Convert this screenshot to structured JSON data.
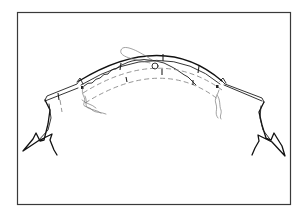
{
  "figure": {
    "type": "line-drawing",
    "colors": {
      "background": "#ffffff",
      "line": "#1e1e1e",
      "stitch": "#8a8a8a",
      "thread": "#7a7a7a",
      "frame": "#3a3a3a"
    },
    "elements": [
      {
        "name": "frame-border",
        "kind": "rectangle"
      },
      {
        "name": "outer-seam-edge",
        "kind": "double-line-arc"
      },
      {
        "name": "gathered-edge",
        "kind": "wavy-line"
      },
      {
        "name": "stitch-line-upper",
        "kind": "dashed-arc"
      },
      {
        "name": "stitch-line-lower",
        "kind": "dashed-arc"
      },
      {
        "name": "notch-marks",
        "kind": "ticks",
        "count": 5
      },
      {
        "name": "thread-loop",
        "kind": "loop-with-knot"
      },
      {
        "name": "thread-end-left",
        "kind": "loose-thread"
      },
      {
        "name": "thread-end-right",
        "kind": "loose-thread"
      },
      {
        "name": "left-panel",
        "kind": "fabric-piece-with-torn-edge"
      },
      {
        "name": "right-panel",
        "kind": "fabric-piece-with-torn-edge"
      }
    ]
  }
}
